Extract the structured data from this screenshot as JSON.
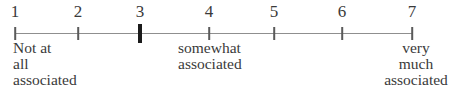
{
  "figure": {
    "type": "rating-scale",
    "background": "#ffffff",
    "axis": {
      "line_color": "#8f8f8f",
      "tick_color": "#5a5a5a",
      "emphasized_tick_color": "#1b1b1b",
      "text_color": "#3a3a3a",
      "x_start": 15,
      "x_end": 412,
      "y": 33
    },
    "points": [
      {
        "value": "1",
        "x": 15,
        "emphasized": false
      },
      {
        "value": "2",
        "x": 78,
        "emphasized": false
      },
      {
        "value": "3",
        "x": 140,
        "emphasized": true
      },
      {
        "value": "4",
        "x": 209,
        "emphasized": false
      },
      {
        "value": "5",
        "x": 274,
        "emphasized": false
      },
      {
        "value": "6",
        "x": 342,
        "emphasized": false
      },
      {
        "value": "7",
        "x": 412,
        "emphasized": false
      }
    ],
    "emphasized_value": "3",
    "anchor_labels": [
      {
        "anchor_value": "1",
        "align": "left",
        "x": 13,
        "lines": [
          "Not at",
          "all",
          "associated"
        ]
      },
      {
        "anchor_value": "4",
        "align": "left",
        "x": 178,
        "lines": [
          "somewhat",
          "associated"
        ]
      },
      {
        "anchor_value": "7",
        "align": "center",
        "x": 416,
        "lines": [
          "very",
          "much",
          "associated"
        ]
      }
    ]
  }
}
